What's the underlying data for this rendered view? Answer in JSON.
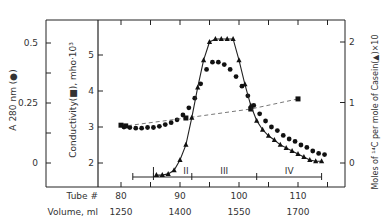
{
  "chart_data": {
    "type": "line",
    "title": "",
    "xlabel_tube": "Tube #",
    "xlabel_volume": "Volume, ml",
    "x_ticks_tube": [
      80,
      90,
      100,
      110
    ],
    "x_ticks_volume": [
      1250,
      1400,
      1550,
      1700
    ],
    "xlim_tube": [
      80,
      117
    ],
    "left_axis_A280": {
      "label": "A 280 nm (●)",
      "ticks": [
        "0",
        "0.25",
        "0.5"
      ],
      "ylim": [
        -0.1,
        0.6
      ]
    },
    "left_axis_conductivity": {
      "label": "Conductivity(■), mho·10³",
      "ticks": [
        "2",
        "3",
        "4",
        "5"
      ],
      "ylim": [
        1.3,
        5.7
      ]
    },
    "right_axis": {
      "label": "Moles of ¹⁴C per mole of Casein(▲)×10",
      "ticks": [
        "0",
        "1",
        "2"
      ],
      "ylim": [
        -0.4,
        2.3
      ]
    },
    "fractions": {
      "labels": [
        "II",
        "III",
        "IV"
      ],
      "bar_start_tube": 82,
      "bar_end_tube": 114,
      "dividers_tube": [
        85.5,
        92,
        103
      ]
    },
    "series": [
      {
        "name": "A280 (circles)",
        "marker": "circle",
        "axis": "A280",
        "x": [
          80.5,
          81.5,
          82.5,
          83.5,
          84.5,
          85.5,
          86.5,
          87.5,
          88.5,
          89.5,
          90.5,
          91.5,
          92.5,
          93.5,
          94.5,
          95.5,
          96.5,
          97.5,
          98.5,
          99.5,
          100.5,
          101.5,
          102.5,
          103.5,
          104.5,
          105.5,
          106.5,
          107.5,
          108.5,
          109.5,
          110.5,
          111.5,
          112.5,
          113.5,
          114.5
        ],
        "values": [
          0.15,
          0.148,
          0.145,
          0.145,
          0.148,
          0.148,
          0.153,
          0.16,
          0.168,
          0.18,
          0.2,
          0.23,
          0.27,
          0.33,
          0.39,
          0.42,
          0.42,
          0.41,
          0.39,
          0.36,
          0.32,
          0.28,
          0.24,
          0.205,
          0.175,
          0.15,
          0.135,
          0.115,
          0.1,
          0.09,
          0.075,
          0.065,
          0.05,
          0.04,
          0.035
        ]
      },
      {
        "name": "Conductivity (squares)",
        "marker": "square",
        "axis": "conductivity",
        "x": [
          80,
          80.8,
          91,
          102,
          110
        ],
        "values": [
          3.05,
          3.03,
          3.25,
          3.5,
          3.78
        ]
      },
      {
        "name": "14C per casein (triangles)",
        "marker": "triangle",
        "axis": "right",
        "x": [
          86,
          87,
          88,
          89,
          90,
          91,
          92,
          93,
          94,
          95,
          96,
          97,
          98,
          99,
          100,
          101,
          102,
          103,
          104,
          105,
          106,
          107,
          108,
          109,
          110,
          111,
          112,
          113,
          114
        ],
        "values": [
          -0.2,
          -0.2,
          -0.18,
          -0.12,
          0.05,
          0.3,
          0.75,
          1.25,
          1.7,
          2.0,
          2.05,
          2.05,
          2.05,
          2.05,
          1.7,
          1.3,
          0.95,
          0.7,
          0.55,
          0.45,
          0.38,
          0.3,
          0.25,
          0.2,
          0.15,
          0.1,
          0.05,
          0.03,
          0.03
        ]
      }
    ]
  }
}
